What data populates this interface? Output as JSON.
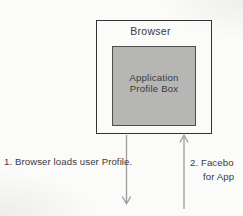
{
  "diagram": {
    "browser_label": "Browser",
    "profile_box_label": "Application Profile Box",
    "annotations": {
      "step1": "1. Browser loads user Profile.",
      "step2_line1": "2. Facebo",
      "step2_line2": "for App"
    },
    "arrows": [
      {
        "name": "down-arrow",
        "direction": "down",
        "from": "browser-box"
      },
      {
        "name": "up-arrow",
        "direction": "up",
        "to": "browser-box"
      }
    ]
  },
  "colors": {
    "background": "#fbfbfa",
    "outer_box_border": "#333333",
    "profile_box_fill": "#b6b6b5",
    "profile_box_border": "#4e4e4e",
    "arrow": "#9b9b9b",
    "text": "#3a3a3a"
  }
}
